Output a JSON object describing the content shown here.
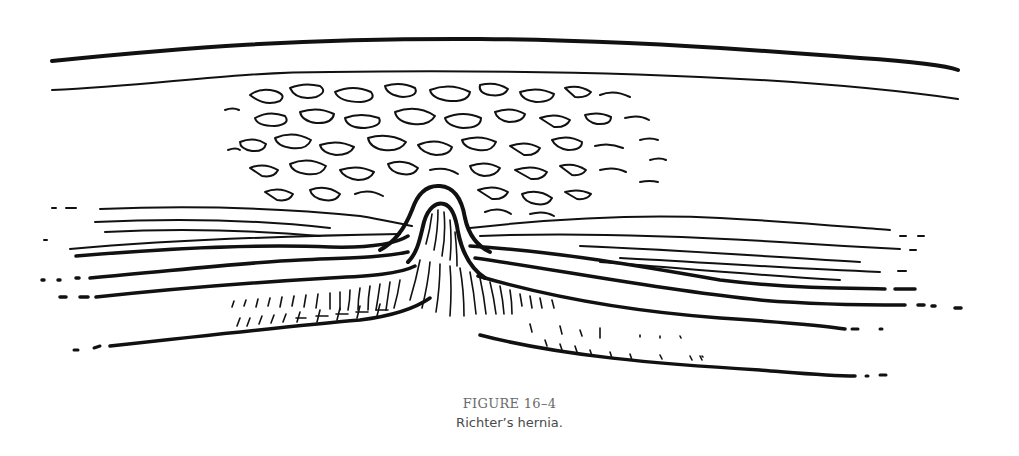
{
  "figure": {
    "label": "FIGURE 16–4",
    "caption": "Richter’s hernia.",
    "illustration": {
      "subject": "richters-hernia-cross-section",
      "layers": [
        "skin",
        "subcutaneous-fat",
        "fascial-layers",
        "peritoneum",
        "bowel-wall"
      ],
      "ink_color": "#111111",
      "background_color": "#ffffff"
    }
  }
}
